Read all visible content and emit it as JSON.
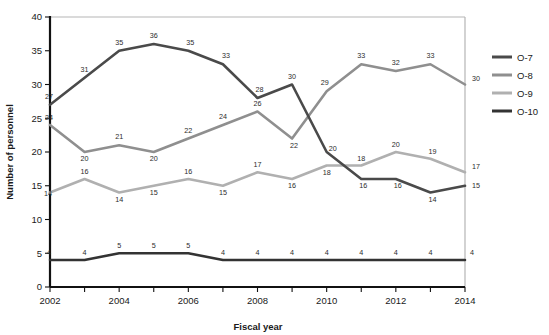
{
  "chart_data": {
    "type": "line",
    "title": "",
    "xlabel": "Fiscal year",
    "ylabel": "Number of personnel",
    "xlim": [
      2002,
      2014
    ],
    "ylim": [
      0,
      40
    ],
    "yticks": [
      0,
      5,
      10,
      15,
      20,
      25,
      30,
      35,
      40
    ],
    "xticks": [
      2002,
      2003,
      2004,
      2005,
      2006,
      2007,
      2008,
      2009,
      2010,
      2011,
      2012,
      2013,
      2014
    ],
    "xtick_labels": [
      "2002",
      "",
      "2004",
      "",
      "2006",
      "",
      "2008",
      "",
      "2010",
      "",
      "2012",
      "",
      "2014"
    ],
    "grid": false,
    "legend_position": "right",
    "x": [
      2002,
      2003,
      2004,
      2005,
      2006,
      2007,
      2008,
      2009,
      2010,
      2011,
      2012,
      2013,
      2014
    ],
    "series": [
      {
        "name": "O-7",
        "color": "#4a4a4a",
        "values": [
          27,
          31,
          35,
          36,
          35,
          33,
          28,
          30,
          20,
          16,
          16,
          14,
          15
        ],
        "labels": [
          "27",
          "31",
          "35",
          "36",
          "35",
          "33",
          "28",
          "30",
          "20",
          "16",
          "16",
          "14",
          "15"
        ]
      },
      {
        "name": "O-8",
        "color": "#8f8f8f",
        "values": [
          24,
          20,
          21,
          20,
          22,
          24,
          26,
          22,
          29,
          33,
          32,
          33,
          30
        ],
        "labels": [
          "24",
          "20",
          "21",
          "20",
          "22",
          "24",
          "26",
          "22",
          "29",
          "33",
          "32",
          "33",
          "30"
        ]
      },
      {
        "name": "O-9",
        "color": "#b0b0b0",
        "values": [
          14,
          16,
          14,
          15,
          16,
          15,
          17,
          16,
          18,
          18,
          20,
          19,
          17
        ],
        "labels": [
          "14",
          "16",
          "14",
          "15",
          "16",
          "15",
          "17",
          "16",
          "18",
          "18",
          "20",
          "19",
          "17"
        ]
      },
      {
        "name": "O-10",
        "color": "#333333",
        "values": [
          4,
          4,
          5,
          5,
          5,
          4,
          4,
          4,
          4,
          4,
          4,
          4,
          4
        ],
        "labels": [
          "4",
          "4",
          "5",
          "5",
          "5",
          "4",
          "4",
          "4",
          "4",
          "4",
          "4",
          "4",
          "4"
        ]
      }
    ]
  },
  "axes": {
    "y_title": "Number of personnel",
    "x_title": "Fiscal year",
    "y_tick_labels": [
      "0",
      "5",
      "10",
      "15",
      "20",
      "25",
      "30",
      "35",
      "40"
    ],
    "x_tick_labels": [
      "2002",
      "2004",
      "2006",
      "2008",
      "2010",
      "2012",
      "2014"
    ]
  },
  "legend": {
    "items": [
      {
        "label": "O-7",
        "color": "#4a4a4a"
      },
      {
        "label": "O-8",
        "color": "#8f8f8f"
      },
      {
        "label": "O-9",
        "color": "#b0b0b0"
      },
      {
        "label": "O-10",
        "color": "#333333"
      }
    ]
  },
  "colors": {
    "frame": "#b5b5b5",
    "axis": "#111111",
    "text": "#1a1a1a",
    "label_text": "#2b2b2b",
    "background": "#ffffff"
  }
}
